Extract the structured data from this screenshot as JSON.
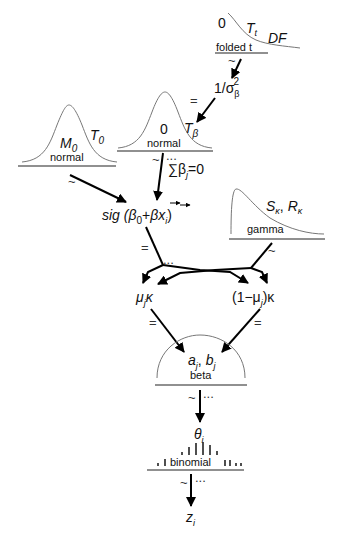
{
  "diagram": {
    "type": "hierarchical-bayesian-model",
    "nodes": {
      "folded_t": {
        "distribution": "folded t",
        "param_left": "0",
        "param_mid": "T",
        "param_mid_sub": "t",
        "param_right": "DF"
      },
      "sigma_beta": {
        "numerator": "1/σ",
        "sub": "β",
        "sup": "2"
      },
      "normal_beta": {
        "distribution": "normal",
        "mean": "0",
        "precision": "T",
        "precision_sub": "β"
      },
      "sum_constraint": {
        "text": "∑β",
        "sub": "j",
        "rest": "=0"
      },
      "normal_0": {
        "distribution": "normal",
        "mean": "M",
        "mean_sub": "0",
        "precision": "T",
        "precision_sub": "0"
      },
      "gamma": {
        "distribution": "gamma",
        "shape": "S",
        "shape_sub": "κ",
        "sep": ",",
        "rate": "R",
        "rate_sub": "κ"
      },
      "sig": {
        "text_prefix": "sig (β",
        "sub0": "0",
        "text_mid": "+",
        "beta_vec": "β",
        "x_vec": "x",
        "x_sub": "i",
        "close": ")"
      },
      "mu_kappa": {
        "text": "μ",
        "sub": "j",
        "tail": "κ"
      },
      "one_minus_mu_kappa": {
        "text": "(1−μ",
        "sub": "j",
        "tail": ")κ"
      },
      "beta": {
        "distribution": "beta",
        "a": "a",
        "a_sub": "j",
        "sep": ",",
        "b": "b",
        "b_sub": "j"
      },
      "theta": {
        "text": "θ",
        "sub": "i"
      },
      "binomial": {
        "distribution": "binomial"
      },
      "z": {
        "text": "z",
        "sub": "i"
      }
    },
    "edge_labels": {
      "tilde": "~",
      "equals": "=",
      "ellipsis": "..."
    }
  }
}
